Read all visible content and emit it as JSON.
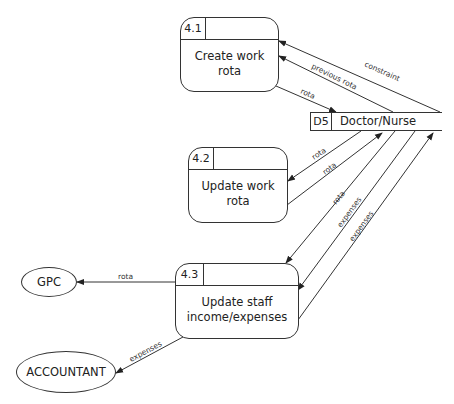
{
  "diagram": {
    "type": "data-flow-diagram",
    "processes": [
      {
        "id": "4.1",
        "title_line1": "Create work",
        "title_line2": "rota"
      },
      {
        "id": "4.2",
        "title_line1": "Update work",
        "title_line2": "rota"
      },
      {
        "id": "4.3",
        "title_line1": "Update staff",
        "title_line2": "income/expenses"
      }
    ],
    "data_store": {
      "id": "D5",
      "name": "Doctor/Nurse"
    },
    "external_entities": [
      {
        "name": "GPC"
      },
      {
        "name": "ACCOUNTANT"
      }
    ],
    "flows": [
      {
        "label": "constraint",
        "from": "D5",
        "to": "4.1"
      },
      {
        "label": "previous rota",
        "from": "D5",
        "to": "4.1"
      },
      {
        "label": "rota",
        "from": "4.1",
        "to": "D5"
      },
      {
        "label": "rota",
        "from": "D5",
        "to": "4.2"
      },
      {
        "label": "rota",
        "from": "4.2",
        "to": "D5"
      },
      {
        "label": "rota",
        "from": "D5",
        "to": "4.3"
      },
      {
        "label": "expenses",
        "from": "D5",
        "to": "4.3"
      },
      {
        "label": "expenses",
        "from": "4.3",
        "to": "D5"
      },
      {
        "label": "rota",
        "from": "4.3",
        "to": "GPC"
      },
      {
        "label": "expenses",
        "from": "4.3",
        "to": "ACCOUNTANT"
      }
    ]
  }
}
